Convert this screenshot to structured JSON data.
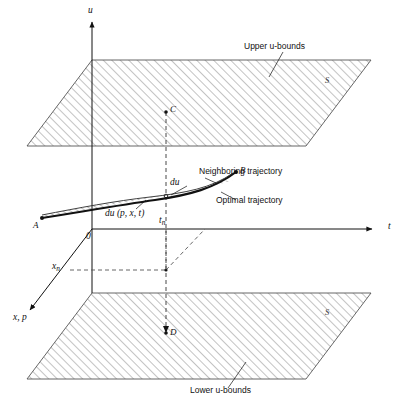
{
  "figure": {
    "type": "diagram"
  },
  "axes": {
    "vertical": {
      "label": "u",
      "name": "u-axis"
    },
    "horizontal": {
      "label": "t",
      "name": "t-axis"
    },
    "depth": {
      "label": "x, p",
      "name": "x-p-axis"
    },
    "origin": {
      "label": "0"
    }
  },
  "planes": {
    "upper": {
      "caption": "Upper u-bounds",
      "surface_label": "S"
    },
    "lower": {
      "caption": "Lower u-bounds",
      "surface_label": "S"
    }
  },
  "trajectories": {
    "optimal": {
      "label": "Optimal trajectory"
    },
    "neighboring": {
      "label": "Neighboring trajectory"
    }
  },
  "annotations": {
    "variation_short": "du",
    "variation_full": "du (p, x, t)"
  },
  "points": [
    {
      "id": "A",
      "label": "A"
    },
    {
      "id": "B",
      "label": "B"
    },
    {
      "id": "C",
      "label": "C"
    },
    {
      "id": "D",
      "label": "D"
    }
  ],
  "ticks": {
    "t_final": "t",
    "t_final_sub": "n",
    "x_value": "x",
    "x_value_sub": "n"
  },
  "colors": {
    "ink": "#111111",
    "hatch": "#6a6a6a",
    "plane_edge": "#555555",
    "dashed": "#555555",
    "band_fill": "#ffffff"
  }
}
